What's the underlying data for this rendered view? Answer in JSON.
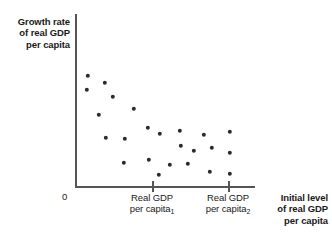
{
  "chart_data": {
    "type": "scatter",
    "title": "",
    "ylabel": "Growth rate of real GDP per capita",
    "xlabel": "Initial level of real GDP per capita",
    "origin_label": "0",
    "grid": false,
    "legend": null,
    "xlim": [
      0,
      1
    ],
    "ylim": [
      0,
      1
    ],
    "x_ticks": [
      {
        "label_line1": "Real GDP",
        "label_line2": "per capita",
        "subscript": "1",
        "pixel_x": 152
      },
      {
        "label_line1": "Real GDP",
        "label_line2": "per capita",
        "subscript": "2",
        "pixel_x": 228
      }
    ],
    "annotation": "Negative relationship: growth rate of real GDP per capita declines as the initial level of real GDP per capita rises (convergence).",
    "points": [
      {
        "x": 88,
        "y": 76
      },
      {
        "x": 105,
        "y": 83
      },
      {
        "x": 87,
        "y": 90
      },
      {
        "x": 113,
        "y": 97
      },
      {
        "x": 99,
        "y": 115
      },
      {
        "x": 134,
        "y": 109
      },
      {
        "x": 106,
        "y": 138
      },
      {
        "x": 125,
        "y": 139
      },
      {
        "x": 148,
        "y": 128
      },
      {
        "x": 160,
        "y": 134
      },
      {
        "x": 124,
        "y": 163
      },
      {
        "x": 149,
        "y": 160
      },
      {
        "x": 159,
        "y": 175
      },
      {
        "x": 180,
        "y": 131
      },
      {
        "x": 181,
        "y": 146
      },
      {
        "x": 194,
        "y": 151
      },
      {
        "x": 170,
        "y": 165
      },
      {
        "x": 188,
        "y": 164
      },
      {
        "x": 204,
        "y": 135
      },
      {
        "x": 212,
        "y": 148
      },
      {
        "x": 210,
        "y": 172
      },
      {
        "x": 230,
        "y": 132
      },
      {
        "x": 230,
        "y": 153
      },
      {
        "x": 230,
        "y": 174
      }
    ]
  }
}
